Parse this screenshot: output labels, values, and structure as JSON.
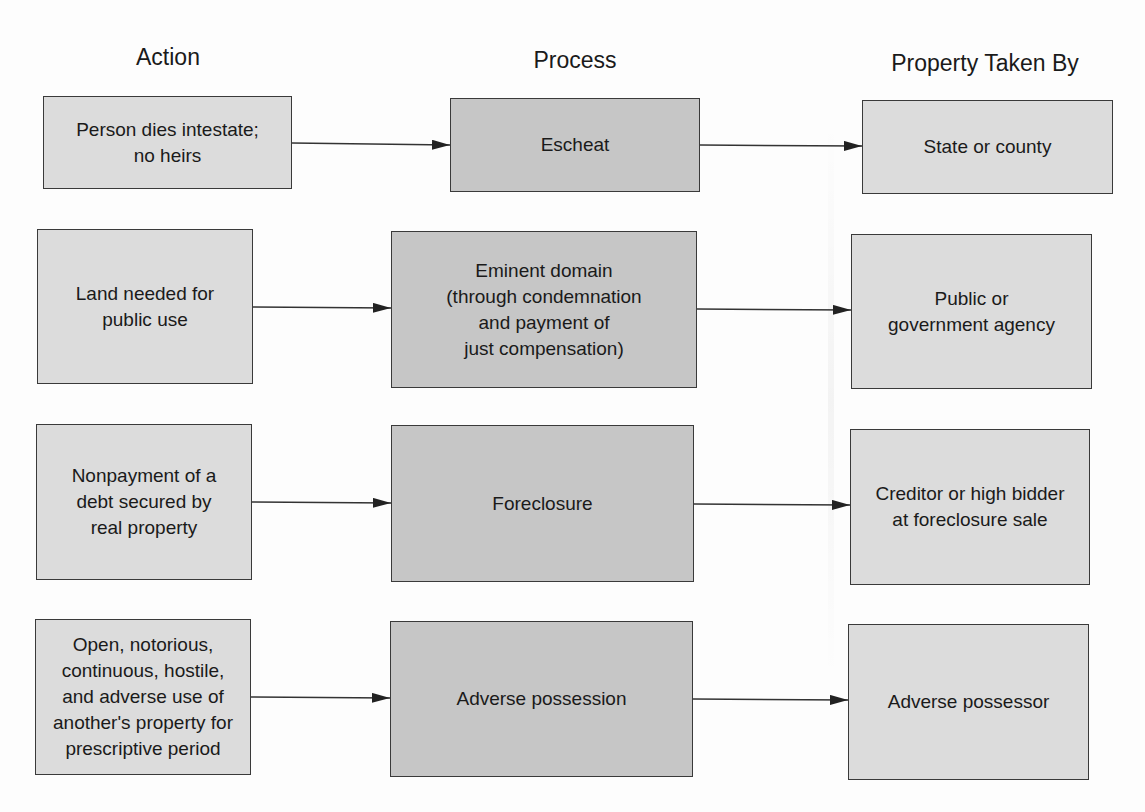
{
  "headers": {
    "action": "Action",
    "process": "Process",
    "taken_by": "Property Taken By"
  },
  "rows": [
    {
      "action": "Person dies intestate;\nno heirs",
      "process": "Escheat",
      "taken_by": "State or county"
    },
    {
      "action": "Land needed for\npublic use",
      "process": "Eminent domain\n(through condemnation\nand payment of\njust compensation)",
      "taken_by": "Public or\ngovernment agency"
    },
    {
      "action": "Nonpayment of a\ndebt secured by\nreal property",
      "process": "Foreclosure",
      "taken_by": "Creditor or high bidder\nat foreclosure sale"
    },
    {
      "action": "Open, notorious,\ncontinuous, hostile,\nand adverse use of\nanother's property for\nprescriptive period",
      "process": "Adverse possession",
      "taken_by": "Adverse possessor"
    }
  ],
  "colors": {
    "light_box": "#dcdcdc",
    "dark_box": "#c6c6c6",
    "border": "#3a3a3a",
    "arrow": "#222222"
  }
}
